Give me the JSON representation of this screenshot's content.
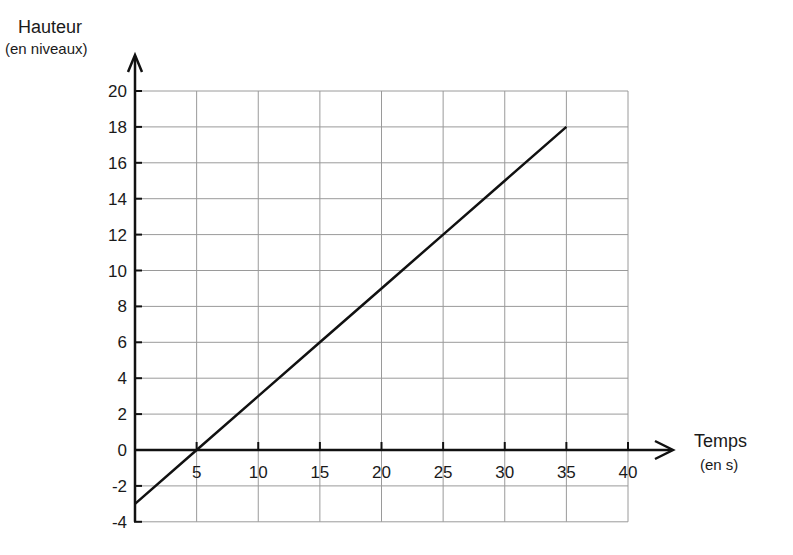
{
  "chart_data": {
    "type": "line",
    "title": "",
    "xlabel": "Temps",
    "xlabel_unit": "(en s)",
    "ylabel": "Hauteur",
    "ylabel_unit": "(en niveaux)",
    "xlim": [
      0,
      40
    ],
    "ylim": [
      -4,
      20
    ],
    "x_ticks": [
      5,
      10,
      15,
      20,
      25,
      30,
      35,
      40
    ],
    "y_ticks": [
      20,
      18,
      16,
      14,
      12,
      10,
      8,
      6,
      4,
      2,
      0,
      -2,
      -4
    ],
    "grid": true,
    "legend": null,
    "series": [
      {
        "name": "Hauteur",
        "x": [
          0,
          5,
          10,
          15,
          20,
          25,
          30,
          35
        ],
        "y": [
          -3,
          0,
          3,
          6,
          9,
          12,
          15,
          18
        ]
      }
    ],
    "colors": {
      "line": "#111111",
      "grid": "#9a9a9a",
      "axis": "#111111"
    }
  }
}
